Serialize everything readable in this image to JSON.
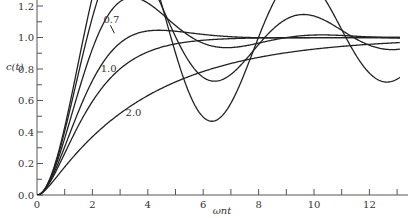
{
  "chart_data": {
    "type": "line",
    "title": "",
    "xlabel": "ωnt",
    "ylabel": "c(t)",
    "xlim": [
      0,
      13.1
    ],
    "ylim": [
      0.0,
      1.25
    ],
    "x_ticks": [
      0,
      2,
      4,
      6,
      8,
      10,
      12
    ],
    "x_minor_ticks": [
      1,
      3,
      5,
      7,
      9,
      11,
      13
    ],
    "y_ticks": [
      "0.0",
      "0.2",
      "0.4",
      "0.6",
      "0.8",
      "1.0",
      "1.2"
    ],
    "grid": false,
    "legend": "inline curve labels",
    "series": [
      {
        "name": "ζ=0.1",
        "zeta": 0.1,
        "label": ""
      },
      {
        "name": "ζ=0.2",
        "zeta": 0.2,
        "label": ""
      },
      {
        "name": "ζ=0.4",
        "zeta": 0.4,
        "label": ""
      },
      {
        "name": "ζ=0.7",
        "zeta": 0.7,
        "label": "0.7"
      },
      {
        "name": "ζ=1.0",
        "zeta": 1.0,
        "label": "1.0"
      },
      {
        "name": "ζ=2.0",
        "zeta": 2.0,
        "label": "2.0"
      }
    ],
    "annotations": [
      {
        "text": "0.7",
        "x": 3.3,
        "y": 1.09
      },
      {
        "text": "1.0",
        "x": 3.2,
        "y": 0.78
      },
      {
        "text": "2.0",
        "x": 4.1,
        "y": 0.5
      }
    ]
  },
  "axes": {
    "x_title": "ωnt",
    "y_title": "c(t)"
  }
}
